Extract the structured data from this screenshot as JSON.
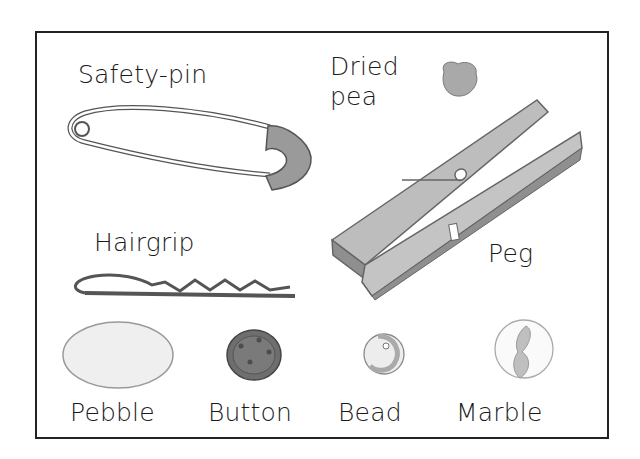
{
  "illustration": {
    "items": [
      {
        "id": "safety-pin",
        "label": "Safety-pin"
      },
      {
        "id": "dried-pea",
        "label_line1": "Dried",
        "label_line2": "pea"
      },
      {
        "id": "hairgrip",
        "label": "Hairgrip"
      },
      {
        "id": "peg",
        "label": "Peg"
      },
      {
        "id": "pebble",
        "label": "Pebble"
      },
      {
        "id": "button",
        "label": "Button"
      },
      {
        "id": "bead",
        "label": "Bead"
      },
      {
        "id": "marble",
        "label": "Marble"
      }
    ],
    "colors": {
      "frame": "#222222",
      "peg_light": "#bdbdbd",
      "peg_dark": "#8f8f8f",
      "pin_head": "#9a9a9a",
      "button": "#6e6e6e",
      "pea": "#a9a9a9"
    }
  }
}
